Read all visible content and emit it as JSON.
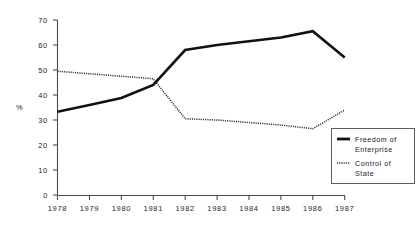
{
  "chart_data": {
    "type": "line",
    "title": "",
    "xlabel": "",
    "ylabel": "%",
    "x": [
      "1978",
      "1979",
      "1980",
      "1981",
      "1982",
      "1983",
      "1984",
      "1985",
      "1986",
      "1987"
    ],
    "ylim": [
      0,
      70
    ],
    "ytick_labels": [
      "70",
      "60",
      "50",
      "40",
      "30",
      "20",
      "10",
      "0"
    ],
    "ytick_values": [
      70,
      60,
      50,
      40,
      30,
      20,
      10,
      0
    ],
    "grid": false,
    "legend_position": "bottom-right",
    "series": [
      {
        "name": "Freedom of Enterprise",
        "style": "solid",
        "color": "#111111",
        "values": [
          33.3,
          36.0,
          38.8,
          44.0,
          58.0,
          60.0,
          61.5,
          63.0,
          65.5,
          55.0
        ]
      },
      {
        "name": "Control of State",
        "style": "dotted",
        "color": "#2b2b2b",
        "values": [
          49.5,
          48.5,
          47.5,
          46.5,
          30.5,
          30.0,
          29.0,
          28.0,
          26.5,
          34.0
        ]
      }
    ]
  },
  "legend": {
    "entries": [
      {
        "line1": "Freedom of",
        "line2": "Enterprise",
        "style": "solid"
      },
      {
        "line1": "Control of",
        "line2": "State",
        "style": "dotted"
      }
    ]
  },
  "axes": {
    "y_axis_title": "%",
    "y_ticks": [
      "70",
      "60",
      "50",
      "40",
      "30",
      "20",
      "10",
      "0"
    ],
    "x_ticks": [
      "1978",
      "1979",
      "1980",
      "1981",
      "1982",
      "1983",
      "1984",
      "1985",
      "1986",
      "1987"
    ]
  }
}
